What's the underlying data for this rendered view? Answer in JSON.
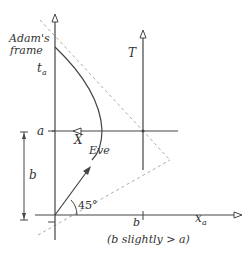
{
  "labels": {
    "frame_line1": "Adam's",
    "frame_line2": "frame",
    "t_axis": "t",
    "t_axis_sub": "a",
    "T": "T",
    "a": "a",
    "X": "X",
    "eve": "Eve",
    "b_left": "b",
    "angle": "45°",
    "b_tick": "b",
    "x_axis": "x",
    "x_axis_sub": "a",
    "caption": "(b slightly > a)"
  },
  "colors": {
    "line": "#444444",
    "dashed": "#aaaaaa"
  }
}
